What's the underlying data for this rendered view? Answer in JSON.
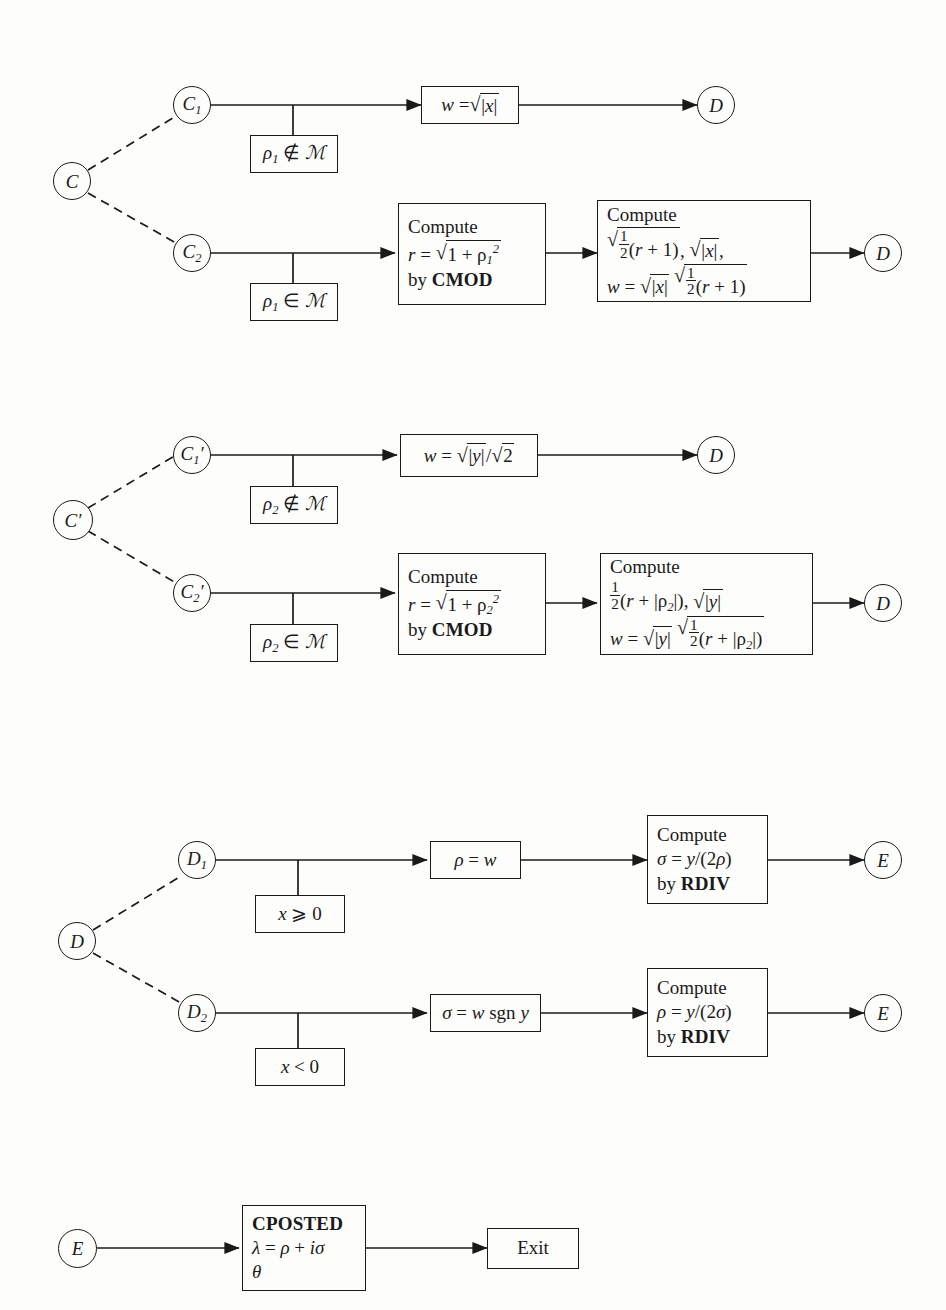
{
  "diagram": {
    "line_color": "#1a1a1a",
    "background": "#fdfdfb"
  },
  "sections": [
    {
      "id": "section-c",
      "entry_node": "C",
      "branches": [
        {
          "node": "C1",
          "node_label": "C",
          "node_sub": "1",
          "condition": "ρ₁ ∉ ℳ",
          "steps": [
            "w = √|x|"
          ],
          "exit_node": "D"
        },
        {
          "node": "C2",
          "node_label": "C",
          "node_sub": "2",
          "condition": "ρ₁ ∈ ℳ",
          "steps": [
            "Compute r = √(1 + ρ₁²) by CMOD",
            "Compute √(½(r + 1)), √|x|, w = √|x| √(½(r + 1))"
          ],
          "exit_node": "D"
        }
      ]
    },
    {
      "id": "section-c-prime",
      "entry_node": "C′",
      "branches": [
        {
          "node": "C1′",
          "node_label": "C",
          "node_sub": "1",
          "condition": "ρ₂ ∉ ℳ",
          "steps": [
            "w = √|y| / √2"
          ],
          "exit_node": "D"
        },
        {
          "node": "C2′",
          "node_label": "C",
          "node_sub": "2",
          "condition": "ρ₂ ∈ ℳ",
          "steps": [
            "Compute r = √(1 + ρ₂²) by CMOD",
            "Compute ½(r + |ρ₂|), √|y| ; w = √|y| √(½(r + |ρ₂|))"
          ],
          "exit_node": "D"
        }
      ]
    },
    {
      "id": "section-d",
      "entry_node": "D",
      "branches": [
        {
          "node": "D1",
          "node_label": "D",
          "node_sub": "1",
          "condition": "x ⩾ 0",
          "steps": [
            "ρ = w",
            "Compute σ = y/(2ρ) by RDIV"
          ],
          "exit_node": "E"
        },
        {
          "node": "D2",
          "node_label": "D",
          "node_sub": "2",
          "condition": "x < 0",
          "steps": [
            "σ = w sgn y",
            "Compute ρ = y/(2σ) by RDIV"
          ],
          "exit_node": "E"
        }
      ]
    },
    {
      "id": "section-e",
      "entry_node": "E",
      "steps": [
        "CPOSTED λ = ρ + iσ θ"
      ],
      "exit_label": "Exit"
    }
  ],
  "labels": {
    "node_C": "C",
    "node_C_prime": "C",
    "node_D": "D",
    "node_E": "E",
    "sub_1": "1",
    "sub_2": "2",
    "prime": "′",
    "compute": "Compute",
    "by": "by",
    "cmod": "CMOD",
    "rdiv": "RDIV",
    "cposted": "CPOSTED",
    "exit": "Exit",
    "theta": "θ",
    "rho": "ρ",
    "sigma": "σ",
    "lambda": "λ",
    "w": "w",
    "r": "r",
    "x": "x",
    "y": "y",
    "i": "i",
    "script_M": "ℳ",
    "not_in": "∉",
    "in": "∈",
    "ge": "⩾",
    "lt": "<",
    "eq": "=",
    "plus": "+",
    "sgn": "sgn",
    "one": "1",
    "two": "2",
    "zero": "0",
    "half_num": "1",
    "half_den": "2",
    "cond_rho1_notin": "ρ₁ ∉ ℳ",
    "cond_rho1_in": "ρ₁ ∈ ℳ",
    "cond_rho2_notin": "ρ₂ ∉ ℳ",
    "cond_rho2_in": "ρ₂ ∈ ℳ",
    "cond_x_ge_0": "x ⩾ 0",
    "cond_x_lt_0": "x < 0"
  }
}
